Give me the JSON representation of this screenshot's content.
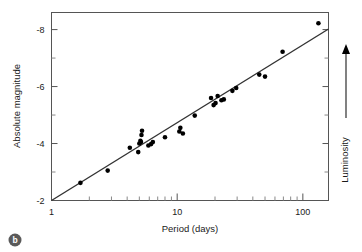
{
  "figure": {
    "panel_label": "b"
  },
  "chart_data": {
    "type": "scatter",
    "title": "",
    "xlabel": "Period (days)",
    "ylabel": "Absolute magnitude",
    "xscale": "log",
    "xlim": [
      1,
      160
    ],
    "ylim": [
      -2,
      -8.6
    ],
    "y_axis_inverted": true,
    "grid": false,
    "legend": null,
    "xticks": [
      1,
      10,
      100
    ],
    "xtick_labels": [
      "1",
      "10",
      "100"
    ],
    "yticks": [
      -2,
      -4,
      -6,
      -8
    ],
    "ytick_labels": [
      "-2",
      "-4",
      "-6",
      "-8"
    ],
    "yminor_ticks": [
      -3,
      -5,
      -7
    ],
    "right_annotation": {
      "label": "Luminosity",
      "arrow_direction": "up"
    },
    "series": [
      {
        "name": "Cepheid variables",
        "marker": "filled-circle",
        "color": "#000000",
        "points": [
          [
            1.7,
            -2.62
          ],
          [
            2.8,
            -3.05
          ],
          [
            4.2,
            -3.85
          ],
          [
            4.9,
            -3.7
          ],
          [
            5.0,
            -4.0
          ],
          [
            5.1,
            -4.1
          ],
          [
            5.15,
            -4.05
          ],
          [
            5.2,
            -4.3
          ],
          [
            5.25,
            -4.45
          ],
          [
            5.9,
            -3.93
          ],
          [
            6.2,
            -3.98
          ],
          [
            6.4,
            -4.05
          ],
          [
            8.0,
            -4.22
          ],
          [
            10.4,
            -4.42
          ],
          [
            10.6,
            -4.55
          ],
          [
            11.1,
            -4.35
          ],
          [
            13.8,
            -4.98
          ],
          [
            18.6,
            -5.6
          ],
          [
            19.5,
            -5.35
          ],
          [
            20.2,
            -5.42
          ],
          [
            21.0,
            -5.67
          ],
          [
            22.5,
            -5.52
          ],
          [
            23.5,
            -5.55
          ],
          [
            27.5,
            -5.85
          ],
          [
            29.5,
            -5.95
          ],
          [
            45.0,
            -6.42
          ],
          [
            50.0,
            -6.35
          ],
          [
            69.0,
            -7.22
          ],
          [
            133.0,
            -8.22
          ]
        ]
      }
    ],
    "fit_line": {
      "name": "period-luminosity relation",
      "color": "#333333",
      "endpoints": [
        [
          1.0,
          -2.0
        ],
        [
          160.0,
          -8.02
        ]
      ]
    }
  }
}
